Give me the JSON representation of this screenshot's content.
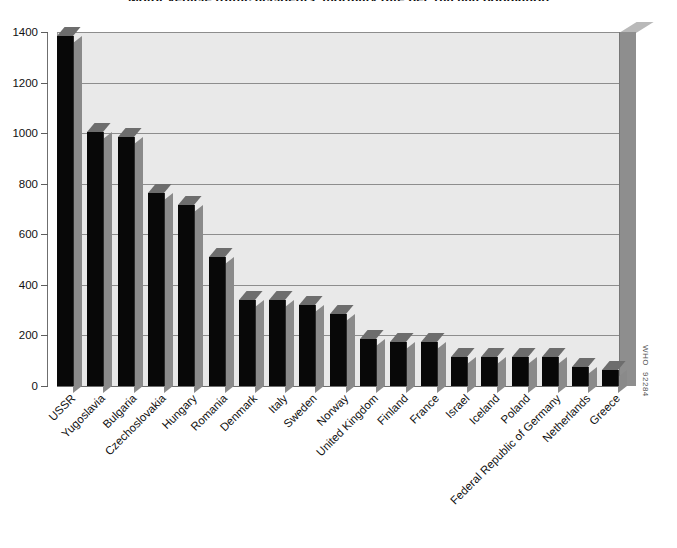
{
  "chart_data": {
    "type": "bar",
    "title": "Motor vehicle traffic accidents, mortality rate per 100 000 population",
    "subtitle": "",
    "xlabel": "",
    "ylabel": "",
    "ylim": [
      0,
      1400
    ],
    "yticks": [
      0,
      200,
      400,
      600,
      800,
      1000,
      1200,
      1400
    ],
    "ytick_labels": [
      "0",
      "200",
      "400",
      "600",
      "800",
      "1000",
      "1200",
      "1400"
    ],
    "grid": true,
    "legend": null,
    "style": "3d-bar",
    "categories": [
      "USSR",
      "Yugoslavia",
      "Bulgaria",
      "Czechoslovakia",
      "Hungary",
      "Romania",
      "Denmark",
      "Italy",
      "Sweden",
      "Norway",
      "United Kingdom",
      "Finland",
      "France",
      "Israel",
      "Iceland",
      "Poland",
      "Federal Republic of Germany",
      "Netherlands",
      "Greece"
    ],
    "values": [
      1385,
      1005,
      985,
      765,
      715,
      510,
      340,
      340,
      320,
      285,
      185,
      175,
      175,
      115,
      115,
      115,
      115,
      75,
      65
    ]
  },
  "watermark": {
    "source": "WHO",
    "code": "92284"
  },
  "colors": {
    "bar_front": "#080808",
    "bar_side": "#8a8a8a",
    "bar_top": "#6d6d6d",
    "plot_background": "#e9e9e9",
    "right_wall": "#8e8e8e",
    "gridline": "#8d8d8d",
    "text": "#111111",
    "page_background": "#ffffff"
  }
}
